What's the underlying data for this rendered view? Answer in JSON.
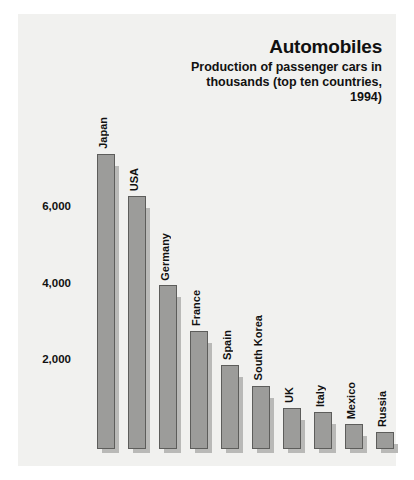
{
  "chart_data": {
    "type": "bar",
    "title": "Automobiles",
    "subtitle": "Production of passenger cars in thousands (top ten countries, 1994)",
    "xlabel": "",
    "ylabel": "",
    "ylim": [
      0,
      8000
    ],
    "grid": false,
    "legend": "none",
    "yticks": [
      "2,000",
      "4,000",
      "6,000"
    ],
    "ytick_values": [
      2000,
      4000,
      6000
    ],
    "categories": [
      "Japan",
      "USA",
      "Germany",
      "France",
      "Spain",
      "South Korea",
      "UK",
      "Italy",
      "Mexico",
      "Russia"
    ],
    "values": [
      7740,
      6630,
      4290,
      3100,
      2210,
      1660,
      1080,
      980,
      660,
      440
    ],
    "units": "thousands of passenger cars",
    "year": 1994
  },
  "colors": {
    "panel_background": "#f1f1ef",
    "bar_fill": "#9c9c9a",
    "bar_border": "#5d5d5b",
    "bar_shadow": "#b9b9b7",
    "text": "#111111",
    "page_background": "#ffffff"
  }
}
